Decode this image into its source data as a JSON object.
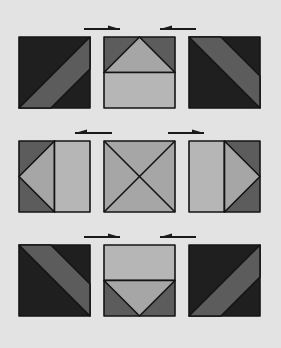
{
  "diagram": {
    "background": "#e3e3e3",
    "colors": {
      "dark": "#1f1f1f",
      "medium": "#5c5c5c",
      "light": "#a6a6a6",
      "lighter": "#b6b6b6",
      "outline": "#141414",
      "arrow": "#1a1a1a"
    },
    "layout": {
      "columns_x": [
        19,
        104,
        189
      ],
      "rows_y": [
        37,
        141,
        245
      ],
      "tile_size": 71
    },
    "rows": [
      {
        "arrows": [
          {
            "from_x": 84,
            "to_x": 120,
            "y": 29,
            "direction": "right"
          },
          {
            "from_x": 196,
            "to_x": 160,
            "y": 29,
            "direction": "left"
          }
        ],
        "tiles": [
          {
            "name": "tile-r1-left",
            "pattern": "diagonal-band-up",
            "description": "dark square with medium diagonal band from bottom-left to top-right"
          },
          {
            "name": "tile-r1-mid",
            "pattern": "triangle-top-half",
            "description": "top half: medium with light upward triangle; bottom half: light rectangle"
          },
          {
            "name": "tile-r1-right",
            "pattern": "diagonal-band-down",
            "description": "dark square with medium diagonal band from top-left to bottom-right"
          }
        ]
      },
      {
        "arrows": [
          {
            "from_x": 112,
            "to_x": 75,
            "y": 133,
            "direction": "left"
          },
          {
            "from_x": 168,
            "to_x": 204,
            "y": 133,
            "direction": "right"
          }
        ],
        "tiles": [
          {
            "name": "tile-r2-left",
            "pattern": "triangle-left-half",
            "description": "left half: medium with light leftward triangle; right half: light rectangle"
          },
          {
            "name": "tile-r2-mid",
            "pattern": "x-cross",
            "description": "light square with two diagonals forming an X"
          },
          {
            "name": "tile-r2-right",
            "pattern": "triangle-right-half",
            "description": "left half: light rectangle; right half: medium with light rightward triangle"
          }
        ]
      },
      {
        "arrows": [
          {
            "from_x": 84,
            "to_x": 120,
            "y": 237,
            "direction": "right"
          },
          {
            "from_x": 196,
            "to_x": 160,
            "y": 237,
            "direction": "left"
          }
        ],
        "tiles": [
          {
            "name": "tile-r3-left",
            "pattern": "diagonal-band-down",
            "description": "dark square with medium diagonal band from top-left to bottom-right"
          },
          {
            "name": "tile-r3-mid",
            "pattern": "triangle-bottom-half",
            "description": "top half: light rectangle; bottom half: medium with light downward triangle"
          },
          {
            "name": "tile-r3-right",
            "pattern": "diagonal-band-up",
            "description": "dark square with medium diagonal band from bottom-left to top-right"
          }
        ]
      }
    ]
  }
}
